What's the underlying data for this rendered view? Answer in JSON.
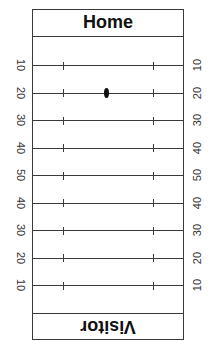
{
  "field": {
    "home_label": "Home",
    "visitor_label": "Visitor",
    "yard_lines": [
      {
        "left": "10",
        "right": "10"
      },
      {
        "left": "20",
        "right": "20"
      },
      {
        "left": "30",
        "right": "30"
      },
      {
        "left": "40",
        "right": "40"
      },
      {
        "left": "50",
        "right": "50"
      },
      {
        "left": "40",
        "right": "40"
      },
      {
        "left": "30",
        "right": "30"
      },
      {
        "left": "20",
        "right": "20"
      },
      {
        "left": "10",
        "right": "10"
      }
    ],
    "ball": {
      "yard_line_index": 1,
      "yard": "20",
      "side": "Home",
      "icon": "football-icon"
    },
    "colors": {
      "lines": "#3a3a3a",
      "text": "#111111",
      "background": "#ffffff"
    }
  }
}
